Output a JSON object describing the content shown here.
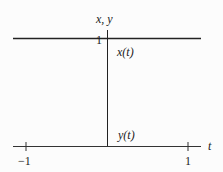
{
  "diagram": {
    "y_axis_label": "x, y",
    "x_axis_label": "t",
    "level_label": "1",
    "tick_left": "−1",
    "tick_right": "1",
    "curve_x_label": "x(t)",
    "curve_y_label": "y(t)",
    "colors": {
      "line": "#222222",
      "background": "#fcfcfc"
    }
  }
}
